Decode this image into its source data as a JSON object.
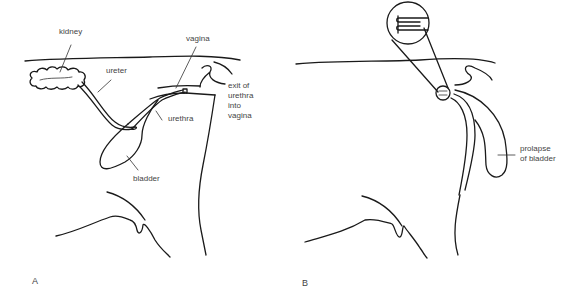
{
  "panels": [
    {
      "id": "A",
      "letter": "A",
      "labels": {
        "kidney": "kidney",
        "ureter": "ureter",
        "vagina": "vagina",
        "exit_line1": "exit of",
        "exit_line2": "urethra",
        "exit_line3": "into",
        "exit_line4": "vagina",
        "urethra": "urethra",
        "bladder": "bladder"
      }
    },
    {
      "id": "B",
      "letter": "B",
      "labels": {
        "prolapse_line1": "prolapse",
        "prolapse_line2": "of bladder"
      }
    }
  ],
  "colors": {
    "line": "#1a1a1a",
    "label_text": "#444444",
    "background": "#ffffff"
  }
}
